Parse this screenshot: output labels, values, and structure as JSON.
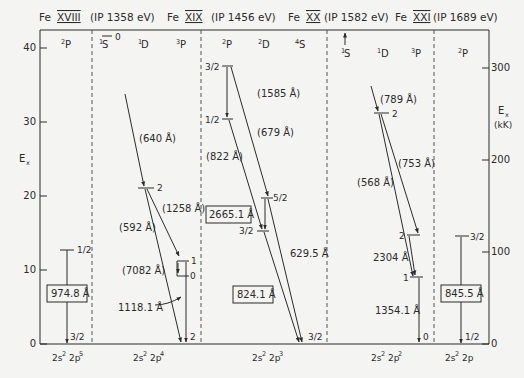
{
  "title_segments": [
    {
      "ion": "Fe",
      "stage": "XVIII",
      "ip": "(IP 1358 eV)"
    },
    {
      "ion": "Fe",
      "stage": "XIX",
      "ip": "(IP 1456 eV)"
    },
    {
      "ion": "Fe",
      "stage": "XX",
      "ip": "(IP 1582 eV)"
    },
    {
      "ion": "Fe",
      "stage": "XXI",
      "ip": "(IP 1689 eV)"
    },
    {
      "ion": "Fe",
      "stage": "XXII",
      "ip": "(IP 1799 eV)"
    }
  ],
  "axes": {
    "left": {
      "label": "E",
      "label_sub": "x",
      "ticks": [
        "0",
        "10",
        "20",
        "30",
        "40"
      ],
      "range": [
        0,
        40
      ]
    },
    "right": {
      "label": "E",
      "label_sub": "x",
      "unit": "(kK)",
      "ticks": [
        "0",
        "100",
        "200",
        "300"
      ],
      "range": [
        0,
        370
      ]
    }
  },
  "panels": [
    {
      "config": {
        "base": "2s",
        "base_sup": "2",
        "outer": "2p",
        "outer_sup": "5"
      },
      "terms": [
        {
          "mult": "2",
          "L": "P"
        }
      ],
      "levels": [
        {
          "J": "1/2",
          "E": 12.7
        },
        {
          "J": "3/2",
          "E": 0
        }
      ],
      "lines": [
        {
          "label": "974.8 Å",
          "boxed": true
        }
      ]
    },
    {
      "config": {
        "base": "2s",
        "base_sup": "2",
        "outer": "2p",
        "outer_sup": "4"
      },
      "terms": [
        {
          "mult": "1",
          "L": "S"
        },
        {
          "mult": "1",
          "L": "D"
        },
        {
          "mult": "3",
          "L": "P"
        }
      ],
      "levels": [
        {
          "term": "1S",
          "J": "0",
          "E": 41.6
        },
        {
          "term": "1D",
          "J": "2",
          "E": 21.0
        },
        {
          "term": "3P",
          "J": "1",
          "E": 11.1
        },
        {
          "term": "3P",
          "J": "0",
          "E": 9.0
        },
        {
          "term": "3P",
          "J": "2",
          "E": 0
        }
      ],
      "lines": [
        {
          "label": "(640 Å)"
        },
        {
          "label": "(1258 Å)"
        },
        {
          "label": "(592 Å)"
        },
        {
          "label": "(7082 Å)"
        },
        {
          "label": "1118.1 Å"
        }
      ]
    },
    {
      "config": {
        "base": "2s",
        "base_sup": "2",
        "outer": "2p",
        "outer_sup": "3"
      },
      "terms": [
        {
          "mult": "2",
          "L": "P"
        },
        {
          "mult": "2",
          "L": "D"
        },
        {
          "mult": "4",
          "L": "S"
        }
      ],
      "levels": [
        {
          "term": "2P",
          "J": "3/2",
          "E": 37.6
        },
        {
          "term": "2P",
          "J": "1/2",
          "E": 30.4
        },
        {
          "term": "2D",
          "J": "5/2",
          "E": 19.4
        },
        {
          "term": "2D",
          "J": "3/2",
          "E": 15.3
        },
        {
          "term": "4S",
          "J": "3/2",
          "E": 0
        }
      ],
      "lines": [
        {
          "label": "(1585 Å)"
        },
        {
          "label": "(679 Å)"
        },
        {
          "label": "(822 Å)"
        },
        {
          "label": "2665.1 Å",
          "boxed": true
        },
        {
          "label": "629.5 Å"
        },
        {
          "label": "824.1 Å",
          "boxed": true
        }
      ]
    },
    {
      "config": {
        "base": "2s",
        "base_sup": "2",
        "outer": "2p",
        "outer_sup": "2"
      },
      "terms": [
        {
          "mult": "1",
          "L": "S"
        },
        {
          "mult": "1",
          "L": "D"
        },
        {
          "mult": "3",
          "L": "P"
        }
      ],
      "levels": [
        {
          "term": "1D",
          "J": "2",
          "E": 31.0
        },
        {
          "term": "3P",
          "J": "2",
          "E": 11.7
        },
        {
          "term": "3P",
          "J": "1",
          "E": 8.6
        },
        {
          "term": "3P",
          "J": "0",
          "E": 0
        }
      ],
      "lines": [
        {
          "label": "(789 Å)"
        },
        {
          "label": "(753 Å)"
        },
        {
          "label": "(568 Å)"
        },
        {
          "label": "2304 Å"
        },
        {
          "label": "1354.1 Å"
        }
      ]
    },
    {
      "config": {
        "base": "2s",
        "base_sup": "2",
        "outer": "2p",
        "outer_sup": ""
      },
      "terms": [
        {
          "mult": "2",
          "L": "P"
        }
      ],
      "levels": [
        {
          "J": "3/2",
          "E": 14.4
        },
        {
          "J": "1/2",
          "E": 0
        }
      ],
      "lines": [
        {
          "label": "845.5 Å",
          "boxed": true
        }
      ]
    }
  ]
}
